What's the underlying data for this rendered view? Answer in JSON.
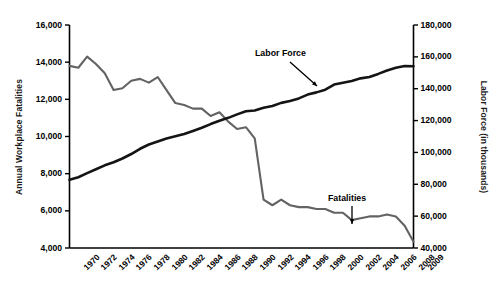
{
  "chart_data": {
    "type": "line",
    "title": "",
    "xlabel": "",
    "grid": false,
    "legend_position": "inline-annotations",
    "x": [
      1970,
      1971,
      1972,
      1973,
      1974,
      1975,
      1976,
      1977,
      1978,
      1979,
      1980,
      1981,
      1982,
      1983,
      1984,
      1985,
      1986,
      1987,
      1988,
      1989,
      1990,
      1991,
      1992,
      1993,
      1994,
      1995,
      1996,
      1997,
      1998,
      1999,
      2000,
      2001,
      2002,
      2003,
      2004,
      2005,
      2006,
      2007,
      2008,
      2009
    ],
    "xtick_labels": [
      "1970",
      "1972",
      "1974",
      "1976",
      "1978",
      "1980",
      "1982",
      "1984",
      "1986",
      "1988",
      "1990",
      "1992",
      "1994",
      "1996",
      "1998",
      "2000",
      "2002",
      "2004",
      "2006",
      "2008",
      "2009"
    ],
    "axes": {
      "left": {
        "label": "Annual Workplace Fatalities",
        "ylim": [
          4000,
          16000
        ],
        "ticks": [
          4000,
          6000,
          8000,
          10000,
          12000,
          14000,
          16000
        ],
        "tick_labels": [
          "4,000",
          "6,000",
          "8,000",
          "10,000",
          "12,000",
          "14,000",
          "16,000"
        ]
      },
      "right": {
        "label": "Labor Force (in thousands)",
        "ylim": [
          40000,
          180000
        ],
        "ticks": [
          40000,
          60000,
          80000,
          100000,
          120000,
          140000,
          160000,
          180000
        ],
        "tick_labels": [
          "40,000",
          "60,000",
          "80,000",
          "100,000",
          "120,000",
          "140,000",
          "160,000",
          "180,000"
        ]
      }
    },
    "series": [
      {
        "name": "Fatalities",
        "axis": "left",
        "color": "#636363",
        "values": [
          13800,
          13700,
          14300,
          13900,
          13400,
          12500,
          12600,
          13000,
          13100,
          12900,
          13200,
          12500,
          11800,
          11700,
          11500,
          11500,
          11100,
          11300,
          10800,
          10400,
          10500,
          9900,
          6600,
          6300,
          6600,
          6300,
          6200,
          6200,
          6100,
          6100,
          5900,
          5900,
          5500,
          5600,
          5700,
          5700,
          5800,
          5700,
          5200,
          4340
        ]
      },
      {
        "name": "Labor Force",
        "axis": "right",
        "color": "#141414",
        "values": [
          82800,
          84400,
          87000,
          89400,
          91900,
          93800,
          96200,
          99000,
          102300,
          105000,
          106900,
          108700,
          110200,
          111600,
          113500,
          115500,
          117800,
          119900,
          121700,
          123900,
          125800,
          126350,
          128100,
          129200,
          131100,
          132300,
          133900,
          136300,
          137700,
          139400,
          142600,
          143700,
          144900,
          146500,
          147400,
          149300,
          151400,
          153100,
          154300,
          154140
        ]
      }
    ],
    "annotations": [
      {
        "name": "labor-force-annotation",
        "text": "Labor Force"
      },
      {
        "name": "fatalities-annotation",
        "text": "Fatalities"
      }
    ]
  },
  "left_ticks": [
    {
      "label": "16,000"
    },
    {
      "label": "14,000"
    },
    {
      "label": "12,000"
    },
    {
      "label": "10,000"
    },
    {
      "label": "8,000"
    },
    {
      "label": "6,000"
    },
    {
      "label": "4,000"
    }
  ],
  "right_ticks": [
    {
      "label": "180,000"
    },
    {
      "label": "160,000"
    },
    {
      "label": "140,000"
    },
    {
      "label": "120,000"
    },
    {
      "label": "100,000"
    },
    {
      "label": "80,000"
    },
    {
      "label": "60,000"
    },
    {
      "label": "40,000"
    }
  ],
  "x_ticks": [
    {
      "label": "1970"
    },
    {
      "label": "1972"
    },
    {
      "label": "1974"
    },
    {
      "label": "1976"
    },
    {
      "label": "1978"
    },
    {
      "label": "1980"
    },
    {
      "label": "1982"
    },
    {
      "label": "1984"
    },
    {
      "label": "1986"
    },
    {
      "label": "1988"
    },
    {
      "label": "1990"
    },
    {
      "label": "1992"
    },
    {
      "label": "1994"
    },
    {
      "label": "1996"
    },
    {
      "label": "1998"
    },
    {
      "label": "2000"
    },
    {
      "label": "2002"
    },
    {
      "label": "2004"
    },
    {
      "label": "2006"
    },
    {
      "label": "2008"
    },
    {
      "label": "2009"
    }
  ],
  "axis_titles": {
    "left": "Annual Workplace Fatalities",
    "right": "Labor Force (in thousands)"
  },
  "annotation_labels": {
    "labor_force": "Labor Force",
    "fatalities": "Fatalities"
  }
}
